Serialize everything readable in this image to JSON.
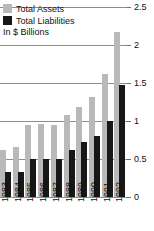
{
  "legend": {
    "items": [
      {
        "label": "Total Assets",
        "color": "#b9b9b9",
        "key": "assets"
      },
      {
        "label": "Total Liabilities",
        "color": "#171717",
        "key": "liabilities"
      }
    ]
  },
  "units_note": "In $ Billions",
  "chart_data": {
    "type": "bar",
    "title": "",
    "subtitle": "",
    "xlabel": "",
    "ylabel": "In $ Billions",
    "ylim": [
      0,
      2.5
    ],
    "yticks": [
      0,
      0.5,
      1,
      1.5,
      2,
      2.5
    ],
    "ytick_labels": [
      "0",
      "0.5",
      "1",
      "1.5",
      "2",
      "2.5"
    ],
    "y_axis_position": "right",
    "grid": true,
    "grid_axis": "y",
    "legend_position": "top-left",
    "categories": [
      "1983",
      "1984",
      "1985",
      "1986",
      "1987",
      "1988",
      "1989",
      "1990",
      "1991",
      "1992"
    ],
    "series": [
      {
        "name": "Total Assets",
        "color": "#b9b9b9",
        "values": [
          0.62,
          0.66,
          0.95,
          0.96,
          0.95,
          1.08,
          1.18,
          1.32,
          1.62,
          2.17
        ]
      },
      {
        "name": "Total Liabilities",
        "color": "#171717",
        "values": [
          0.33,
          0.33,
          0.5,
          0.5,
          0.5,
          0.62,
          0.72,
          0.8,
          1.0,
          1.47
        ]
      }
    ]
  }
}
